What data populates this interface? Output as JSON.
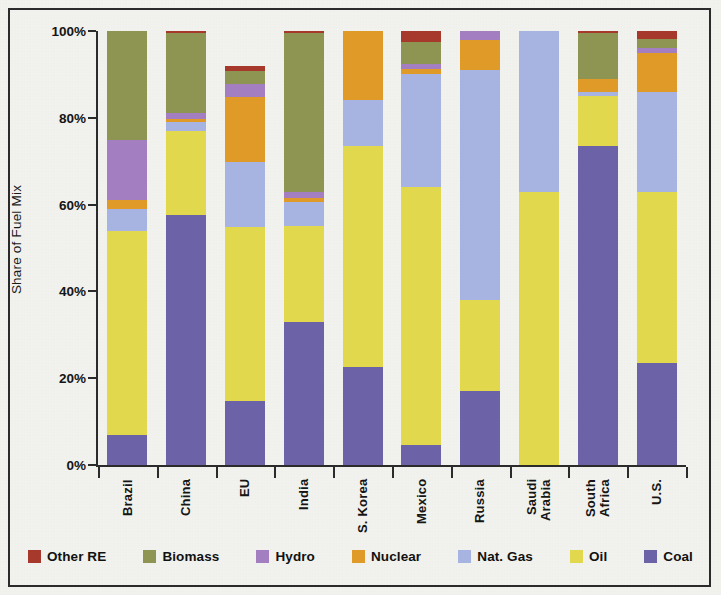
{
  "chart_data": {
    "type": "bar",
    "subtype": "stacked-100-percent",
    "title": "",
    "xlabel": "",
    "ylabel": "Share of Fuel Mix",
    "ylim": [
      0,
      100
    ],
    "yticks": [
      0,
      20,
      40,
      60,
      80,
      100
    ],
    "ytick_labels": [
      "0%",
      "20%",
      "40%",
      "60%",
      "80%",
      "100%"
    ],
    "grid": false,
    "legend_position": "bottom",
    "categories": [
      "Brazil",
      "China",
      "EU",
      "India",
      "S. Korea",
      "Mexico",
      "Russia",
      "Saudi Arabia",
      "South Africa",
      "U.S."
    ],
    "category_lines": [
      [
        "Brazil"
      ],
      [
        "China"
      ],
      [
        "EU"
      ],
      [
        "India"
      ],
      [
        "S. Korea"
      ],
      [
        "Mexico"
      ],
      [
        "Russia"
      ],
      [
        "Saudi",
        "Arabia"
      ],
      [
        "South",
        "Africa"
      ],
      [
        "U.S."
      ]
    ],
    "series": [
      {
        "name": "Coal",
        "color": "#6b62a8",
        "values": [
          7.0,
          57.5,
          14.8,
          33.0,
          22.5,
          4.5,
          17.0,
          0.0,
          73.5,
          23.5
        ]
      },
      {
        "name": "Oil",
        "color": "#e2d84e",
        "values": [
          47.0,
          19.5,
          40.0,
          22.0,
          51.0,
          59.5,
          21.0,
          63.0,
          11.5,
          39.5
        ]
      },
      {
        "name": "Nat. Gas",
        "color": "#a7b4e2",
        "values": [
          5.0,
          2.0,
          15.0,
          5.5,
          10.5,
          26.0,
          53.0,
          37.0,
          1.0,
          23.0
        ]
      },
      {
        "name": "Nuclear",
        "color": "#e09a28",
        "values": [
          2.0,
          0.8,
          15.0,
          1.0,
          16.0,
          1.2,
          7.0,
          0.0,
          3.0,
          9.0
        ]
      },
      {
        "name": "Hydro",
        "color": "#a37fc2",
        "values": [
          14.0,
          1.2,
          3.0,
          1.5,
          0.0,
          1.3,
          2.0,
          0.0,
          0.0,
          1.2
        ]
      },
      {
        "name": "Biomass",
        "color": "#8e9553",
        "values": [
          25.0,
          18.5,
          3.0,
          36.5,
          0.0,
          5.0,
          0.0,
          0.0,
          10.5,
          2.0
        ]
      },
      {
        "name": "Other RE",
        "color": "#a6392c",
        "values": [
          0.0,
          0.5,
          1.2,
          0.5,
          0.0,
          2.5,
          0.0,
          0.0,
          0.5,
          1.8
        ]
      }
    ],
    "legend": [
      {
        "label": "Other RE",
        "color": "#a6392c"
      },
      {
        "label": "Biomass",
        "color": "#8e9553"
      },
      {
        "label": "Hydro",
        "color": "#a37fc2"
      },
      {
        "label": "Nuclear",
        "color": "#e09a28"
      },
      {
        "label": "Nat. Gas",
        "color": "#a7b4e2"
      },
      {
        "label": "Oil",
        "color": "#e2d84e"
      },
      {
        "label": "Coal",
        "color": "#6b62a8"
      }
    ]
  }
}
